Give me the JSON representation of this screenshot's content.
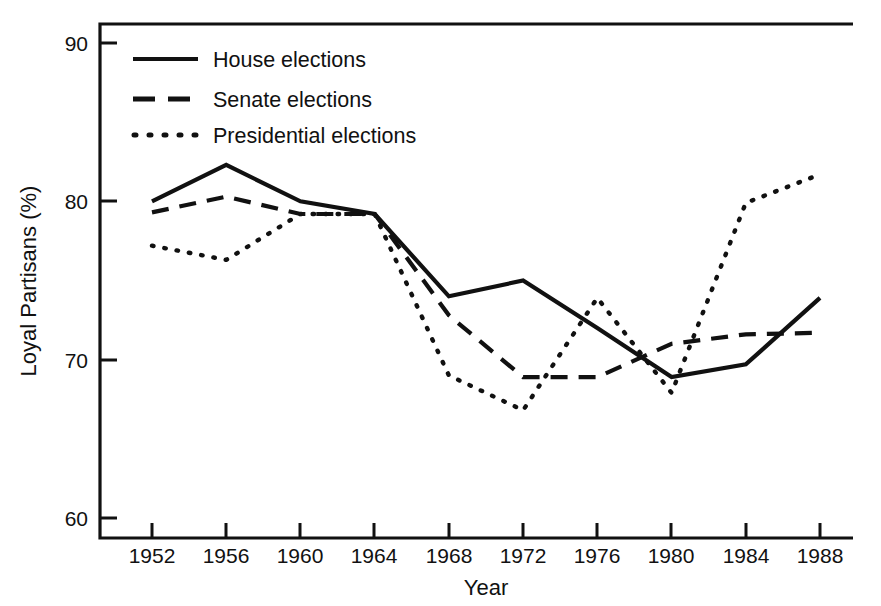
{
  "chart_data": {
    "type": "line",
    "title": "",
    "xlabel": "Year",
    "ylabel": "Loyal Partisans (%)",
    "categories": [
      1952,
      1956,
      1960,
      1964,
      1968,
      1972,
      1976,
      1980,
      1984,
      1988
    ],
    "xtick_labels": [
      "1952",
      "1956",
      "1960",
      "1964",
      "1968",
      "1972",
      "1976",
      "1980",
      "1984",
      "1988"
    ],
    "ytick_labels": [
      "60",
      "70",
      "80",
      "90"
    ],
    "yticks": [
      60,
      70,
      80,
      90
    ],
    "xlim": [
      1952,
      1988
    ],
    "ylim": [
      60,
      90
    ],
    "grid": false,
    "legend_position": "upper-left-inside",
    "line_color": "#111111",
    "background_color": "#ffffff",
    "series": [
      {
        "name": "House elections",
        "style": "solid",
        "values": [
          80.0,
          82.3,
          80.0,
          79.2,
          74.0,
          75.0,
          72.0,
          68.9,
          69.7,
          73.9
        ]
      },
      {
        "name": "Senate elections",
        "style": "dashed",
        "values": [
          79.3,
          80.3,
          79.2,
          79.2,
          72.8,
          68.9,
          68.9,
          71.0,
          71.6,
          71.7
        ]
      },
      {
        "name": "Presidential elections",
        "style": "dotted",
        "values": [
          77.2,
          76.3,
          79.2,
          79.2,
          69.0,
          66.8,
          73.9,
          67.9,
          79.9,
          81.7
        ]
      }
    ]
  },
  "legend": {
    "items": [
      {
        "label": "House elections",
        "style": "solid"
      },
      {
        "label": "Senate elections",
        "style": "dashed"
      },
      {
        "label": "Presidential elections",
        "style": "dotted"
      }
    ]
  }
}
